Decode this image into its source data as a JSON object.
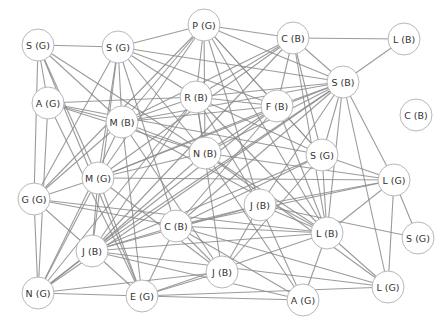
{
  "diagram": {
    "type": "network-graph",
    "nodes": [
      {
        "id": "n1",
        "label": "S (G)"
      },
      {
        "id": "n2",
        "label": "S (G)"
      },
      {
        "id": "n3",
        "label": "P (G)"
      },
      {
        "id": "n4",
        "label": "C (B)"
      },
      {
        "id": "n5",
        "label": "L (B)"
      },
      {
        "id": "n6",
        "label": "S (B)"
      },
      {
        "id": "n7",
        "label": "R (B)"
      },
      {
        "id": "n8",
        "label": "F (B)"
      },
      {
        "id": "n9",
        "label": "C (B)"
      },
      {
        "id": "n10",
        "label": "A (G)"
      },
      {
        "id": "n11",
        "label": "M (B)"
      },
      {
        "id": "n12",
        "label": "N (B)"
      },
      {
        "id": "n13",
        "label": "S (G)"
      },
      {
        "id": "n14",
        "label": "M (G)"
      },
      {
        "id": "n15",
        "label": "L (G)"
      },
      {
        "id": "n16",
        "label": "G (G)"
      },
      {
        "id": "n17",
        "label": "J (B)"
      },
      {
        "id": "n18",
        "label": "C (B)"
      },
      {
        "id": "n19",
        "label": "L (B)"
      },
      {
        "id": "n20",
        "label": "S (G)"
      },
      {
        "id": "n21",
        "label": "J (B)"
      },
      {
        "id": "n22",
        "label": "J (B)"
      },
      {
        "id": "n23",
        "label": "N (G)"
      },
      {
        "id": "n24",
        "label": "E (G)"
      },
      {
        "id": "n25",
        "label": "A (G)"
      },
      {
        "id": "n26",
        "label": "L (G)"
      }
    ],
    "edges": [
      [
        "n1",
        "n2"
      ],
      [
        "n1",
        "n10"
      ],
      [
        "n1",
        "n11"
      ],
      [
        "n1",
        "n16"
      ],
      [
        "n1",
        "n14"
      ],
      [
        "n1",
        "n12"
      ],
      [
        "n1",
        "n24"
      ],
      [
        "n2",
        "n3"
      ],
      [
        "n2",
        "n7"
      ],
      [
        "n2",
        "n11"
      ],
      [
        "n2",
        "n14"
      ],
      [
        "n2",
        "n12"
      ],
      [
        "n2",
        "n8"
      ],
      [
        "n2",
        "n6"
      ],
      [
        "n2",
        "n16"
      ],
      [
        "n2",
        "n21"
      ],
      [
        "n2",
        "n18"
      ],
      [
        "n3",
        "n4"
      ],
      [
        "n3",
        "n7"
      ],
      [
        "n3",
        "n11"
      ],
      [
        "n3",
        "n12"
      ],
      [
        "n3",
        "n8"
      ],
      [
        "n3",
        "n6"
      ],
      [
        "n3",
        "n13"
      ],
      [
        "n3",
        "n14"
      ],
      [
        "n3",
        "n16"
      ],
      [
        "n3",
        "n19"
      ],
      [
        "n3",
        "n17"
      ],
      [
        "n4",
        "n5"
      ],
      [
        "n4",
        "n6"
      ],
      [
        "n4",
        "n7"
      ],
      [
        "n4",
        "n8"
      ],
      [
        "n4",
        "n13"
      ],
      [
        "n4",
        "n11"
      ],
      [
        "n4",
        "n19"
      ],
      [
        "n4",
        "n14"
      ],
      [
        "n4",
        "n21"
      ],
      [
        "n5",
        "n6"
      ],
      [
        "n6",
        "n7"
      ],
      [
        "n6",
        "n8"
      ],
      [
        "n6",
        "n11"
      ],
      [
        "n6",
        "n12"
      ],
      [
        "n6",
        "n13"
      ],
      [
        "n6",
        "n15"
      ],
      [
        "n6",
        "n17"
      ],
      [
        "n6",
        "n18"
      ],
      [
        "n6",
        "n19"
      ],
      [
        "n6",
        "n26"
      ],
      [
        "n6",
        "n21"
      ],
      [
        "n6",
        "n23"
      ],
      [
        "n6",
        "n14"
      ],
      [
        "n7",
        "n8"
      ],
      [
        "n7",
        "n10"
      ],
      [
        "n7",
        "n11"
      ],
      [
        "n7",
        "n12"
      ],
      [
        "n7",
        "n13"
      ],
      [
        "n7",
        "n19"
      ],
      [
        "n7",
        "n17"
      ],
      [
        "n7",
        "n23"
      ],
      [
        "n7",
        "n21"
      ],
      [
        "n7",
        "n22"
      ],
      [
        "n8",
        "n11"
      ],
      [
        "n8",
        "n13"
      ],
      [
        "n8",
        "n19"
      ],
      [
        "n8",
        "n12"
      ],
      [
        "n8",
        "n18"
      ],
      [
        "n8",
        "n23"
      ],
      [
        "n8",
        "n14"
      ],
      [
        "n10",
        "n11"
      ],
      [
        "n10",
        "n12"
      ],
      [
        "n10",
        "n13"
      ],
      [
        "n10",
        "n24"
      ],
      [
        "n10",
        "n23"
      ],
      [
        "n11",
        "n12"
      ],
      [
        "n11",
        "n16"
      ],
      [
        "n11",
        "n23"
      ],
      [
        "n11",
        "n22"
      ],
      [
        "n11",
        "n19"
      ],
      [
        "n11",
        "n24"
      ],
      [
        "n12",
        "n15"
      ],
      [
        "n12",
        "n19"
      ],
      [
        "n12",
        "n14"
      ],
      [
        "n12",
        "n21"
      ],
      [
        "n12",
        "n25"
      ],
      [
        "n12",
        "n26"
      ],
      [
        "n13",
        "n19"
      ],
      [
        "n13",
        "n15"
      ],
      [
        "n13",
        "n21"
      ],
      [
        "n13",
        "n18"
      ],
      [
        "n13",
        "n22"
      ],
      [
        "n14",
        "n15"
      ],
      [
        "n14",
        "n16"
      ],
      [
        "n14",
        "n21"
      ],
      [
        "n14",
        "n23"
      ],
      [
        "n14",
        "n24"
      ],
      [
        "n14",
        "n22"
      ],
      [
        "n15",
        "n17"
      ],
      [
        "n15",
        "n19"
      ],
      [
        "n15",
        "n20"
      ],
      [
        "n15",
        "n26"
      ],
      [
        "n15",
        "n18"
      ],
      [
        "n16",
        "n18"
      ],
      [
        "n16",
        "n21"
      ],
      [
        "n16",
        "n23"
      ],
      [
        "n16",
        "n19"
      ],
      [
        "n17",
        "n18"
      ],
      [
        "n17",
        "n19"
      ],
      [
        "n17",
        "n21"
      ],
      [
        "n17",
        "n22"
      ],
      [
        "n17",
        "n25"
      ],
      [
        "n17",
        "n20"
      ],
      [
        "n18",
        "n19"
      ],
      [
        "n18",
        "n21"
      ],
      [
        "n18",
        "n22"
      ],
      [
        "n18",
        "n24"
      ],
      [
        "n18",
        "n25"
      ],
      [
        "n18",
        "n26"
      ],
      [
        "n19",
        "n21"
      ],
      [
        "n19",
        "n25"
      ],
      [
        "n19",
        "n26"
      ],
      [
        "n19",
        "n24"
      ],
      [
        "n21",
        "n23"
      ],
      [
        "n21",
        "n24"
      ],
      [
        "n21",
        "n26"
      ],
      [
        "n21",
        "n25"
      ],
      [
        "n22",
        "n23"
      ],
      [
        "n22",
        "n24"
      ],
      [
        "n23",
        "n24"
      ],
      [
        "n24",
        "n25"
      ],
      [
        "n24",
        "n26"
      ]
    ]
  }
}
